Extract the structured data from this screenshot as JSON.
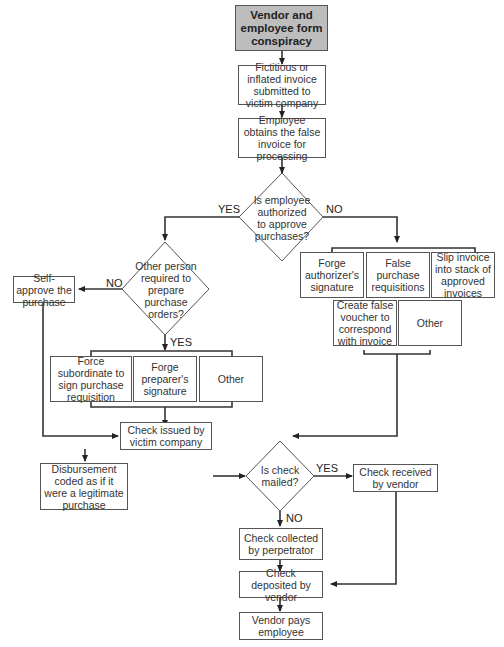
{
  "nodes": {
    "start": "Vendor and employee form conspiracy",
    "fictitious_invoice": "Fictitious or inflated invoice submitted to victim company",
    "employee_obtains": "Employee obtains the false invoice for processing",
    "q_authorized": "Is employee authorized to approve purchases?",
    "q_other_person": "Other person required to prepare purchase orders?",
    "self_approve": "Self-approve the purchase",
    "force_subordinate": "Force subordinate to sign purchase requisition",
    "forge_preparer": "Forge preparer's signature",
    "other_left": "Other",
    "forge_authorizer": "Forge authorizer's signature",
    "false_requisitions": "False purchase requisitions",
    "slip_invoice": "Slip invoice into stack of approved invoices",
    "create_voucher": "Create false voucher to correspond with invoice",
    "other_right": "Other",
    "check_issued": "Check issued by victim company",
    "disbursement_coded": "Disbursement coded as if it were a legitimate purchase",
    "q_check_mailed": "Is check mailed?",
    "check_received": "Check received by vendor",
    "check_collected": "Check collected by perpetrator",
    "check_deposited": "Check deposited by vendor",
    "vendor_pays": "Vendor pays employee"
  },
  "labels": {
    "yes": "YES",
    "no": "NO"
  },
  "colors": {
    "start_fill": "#bdbdbd",
    "line": "#333333",
    "border": "#555555"
  }
}
